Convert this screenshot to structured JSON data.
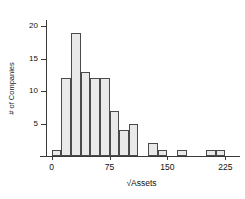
{
  "chart_data": {
    "type": "bar",
    "title": "",
    "xlabel": "√Assets",
    "ylabel": "# of Companies",
    "xlim": [
      -6,
      244
    ],
    "ylim": [
      0,
      21
    ],
    "grid": false,
    "legend": null,
    "bin_width": 12.5,
    "categories": [
      "0–12.5",
      "12.5–25",
      "25–37.5",
      "37.5–50",
      "50–62.5",
      "62.5–75",
      "75–87.5",
      "87.5–100",
      "100–112.5",
      "125–137.5",
      "137.5–150",
      "162.5–175",
      "200–212.5",
      "212.5–225"
    ],
    "bins": [
      {
        "x0": 0,
        "x1": 12.5,
        "value": 1
      },
      {
        "x0": 12.5,
        "x1": 25,
        "value": 12
      },
      {
        "x0": 25,
        "x1": 37.5,
        "value": 19
      },
      {
        "x0": 37.5,
        "x1": 50,
        "value": 13
      },
      {
        "x0": 50,
        "x1": 62.5,
        "value": 12
      },
      {
        "x0": 62.5,
        "x1": 75,
        "value": 12
      },
      {
        "x0": 75,
        "x1": 87.5,
        "value": 7
      },
      {
        "x0": 87.5,
        "x1": 100,
        "value": 4
      },
      {
        "x0": 100,
        "x1": 112.5,
        "value": 5
      },
      {
        "x0": 125,
        "x1": 137.5,
        "value": 2
      },
      {
        "x0": 137.5,
        "x1": 150,
        "value": 1
      },
      {
        "x0": 162.5,
        "x1": 175,
        "value": 1
      },
      {
        "x0": 200,
        "x1": 212.5,
        "value": 1
      },
      {
        "x0": 212.5,
        "x1": 225,
        "value": 1
      }
    ],
    "values": [
      1,
      12,
      19,
      13,
      12,
      12,
      7,
      4,
      5,
      2,
      1,
      1,
      1,
      1
    ],
    "xticks": [
      {
        "value": 0,
        "label": "0"
      },
      {
        "value": 75,
        "label": "75"
      },
      {
        "value": 150,
        "label": "150"
      },
      {
        "value": 225,
        "label": "225"
      }
    ],
    "yticks": [
      {
        "value": 5,
        "label": "5"
      },
      {
        "value": 10,
        "label": "10"
      },
      {
        "value": 15,
        "label": "15"
      },
      {
        "value": 20,
        "label": "20"
      }
    ],
    "colors": {
      "bar_fill": "#e9e9e9",
      "bar_border": "#4a4a4a",
      "axis": "#3a3a3a",
      "text": "#111111",
      "background": "#ffffff"
    }
  }
}
